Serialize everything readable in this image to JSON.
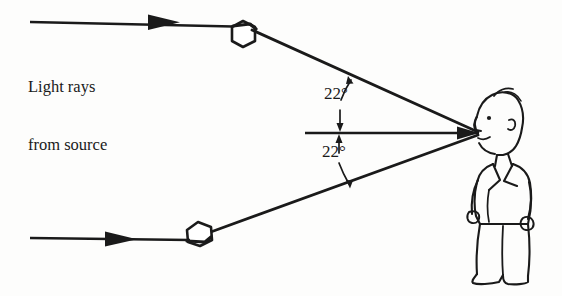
{
  "figure": {
    "background_color": "#fdfdfc",
    "ink_color": "#1a1a1a"
  },
  "labels": {
    "source_caption_line1": "Light rays",
    "source_caption_line2": "from source",
    "angle_upper": "22°",
    "angle_lower": "22°"
  },
  "diagram_data": {
    "type": "ray-diagram",
    "halo_angle_degrees": 22,
    "observer": "person facing left",
    "elements": [
      {
        "name": "incoming-ray-upper",
        "description": "horizontal ray from source to upper ice crystal",
        "direction": "left-to-right"
      },
      {
        "name": "incoming-ray-lower",
        "description": "horizontal ray from source to lower ice crystal",
        "direction": "left-to-right"
      },
      {
        "name": "ice-crystal-upper",
        "description": "hexagonal ice crystal refracting upper ray"
      },
      {
        "name": "ice-crystal-lower",
        "description": "hexagonal ice crystal refracting lower ray"
      },
      {
        "name": "refracted-ray-upper",
        "description": "ray deviated downward toward observer eye, 22 degrees above line of sight"
      },
      {
        "name": "refracted-ray-lower",
        "description": "ray deviated upward toward observer eye, 22 degrees below line of sight"
      },
      {
        "name": "line-of-sight",
        "description": "horizontal reference axis to observer eye"
      }
    ],
    "geometry": {
      "eye_point": [
        478,
        133
      ],
      "upper_crystal": [
        243,
        32
      ],
      "lower_crystal": [
        199,
        232
      ],
      "upper_ray_start": [
        30,
        22
      ],
      "lower_ray_start": [
        30,
        238
      ],
      "line_of_sight_start": [
        305,
        133
      ]
    }
  }
}
